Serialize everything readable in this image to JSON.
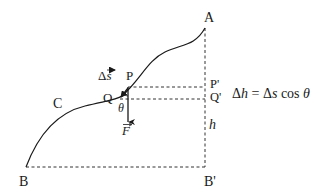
{
  "diagram": {
    "type": "physics-work-gravity-curve",
    "colors": {
      "line": "#1a1a1a",
      "dashed": "#333333",
      "background": "#ffffff"
    },
    "points": {
      "A": "A",
      "B": "B",
      "B_prime": "B'",
      "C": "C",
      "P": "P",
      "Q": "Q",
      "P_prime": "P'",
      "Q_prime": "Q'"
    },
    "labels": {
      "delta_s": "Δs",
      "vector_arrow": "→",
      "theta": "θ",
      "force": "F",
      "height": "h"
    },
    "formula": {
      "lhs_delta": "Δ",
      "lhs_var": "h",
      "equals": " = ",
      "rhs_delta": "Δ",
      "rhs_var": "s",
      "rhs_func": " cos ",
      "rhs_angle": "θ"
    }
  }
}
